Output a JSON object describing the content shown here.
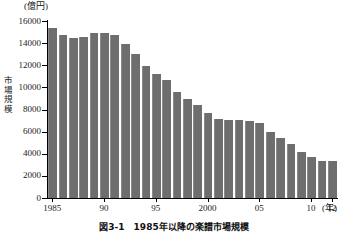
{
  "chart_data": {
    "type": "bar",
    "title": "図3-1　1985年以降の楽譜市場規模",
    "xlabel": "(年)",
    "ylabel": "市場規模",
    "yunit": "(億円)",
    "ylim": [
      0,
      16000
    ],
    "ytick_labels": [
      "0",
      "2000",
      "4000",
      "6000",
      "8000",
      "10000",
      "12000",
      "14000",
      "16000"
    ],
    "ytick_values": [
      0,
      2000,
      4000,
      6000,
      8000,
      10000,
      12000,
      14000,
      16000
    ],
    "xtick_labels": [
      "1985",
      "90",
      "95",
      "2000",
      "05",
      "10",
      "12"
    ],
    "xtick_years": [
      1985,
      1990,
      1995,
      2000,
      2005,
      2010,
      2012
    ],
    "grid": false,
    "legend": "none",
    "bar_color": "#6e6e6e",
    "categories": [
      1985,
      1986,
      1987,
      1988,
      1989,
      1990,
      1991,
      1992,
      1993,
      1994,
      1995,
      1996,
      1997,
      1998,
      1999,
      2000,
      2001,
      2002,
      2003,
      2004,
      2005,
      2006,
      2007,
      2008,
      2009,
      2010,
      2011,
      2012
    ],
    "values": [
      15350,
      14700,
      14500,
      14600,
      14900,
      14900,
      14750,
      13950,
      13000,
      11950,
      11250,
      10700,
      9550,
      8950,
      8450,
      7700,
      7100,
      7050,
      7050,
      7000,
      6800,
      6000,
      5450,
      4900,
      4150,
      3700,
      3350,
      3350
    ]
  },
  "caption": {
    "text": "図3-1　1985年以降の楽譜市場規模"
  }
}
